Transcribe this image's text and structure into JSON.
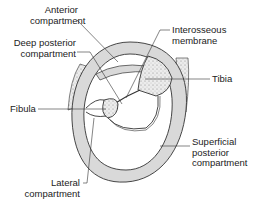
{
  "diagram": {
    "colors": {
      "tissue": "#d9d9d9",
      "outline": "#333333",
      "bone": "#e8e8e8",
      "background": "#ffffff"
    },
    "labels": {
      "anterior": [
        "Anterior",
        "compartment"
      ],
      "deep_posterior": [
        "Deep posterior",
        "compartment"
      ],
      "interosseous": [
        "Interosseous",
        "membrane"
      ],
      "tibia": "Tibia",
      "fibula": "Fibula",
      "superficial_posterior": [
        "Superficial",
        "posterior",
        "compartment"
      ],
      "lateral": [
        "Lateral",
        "compartment"
      ]
    }
  }
}
